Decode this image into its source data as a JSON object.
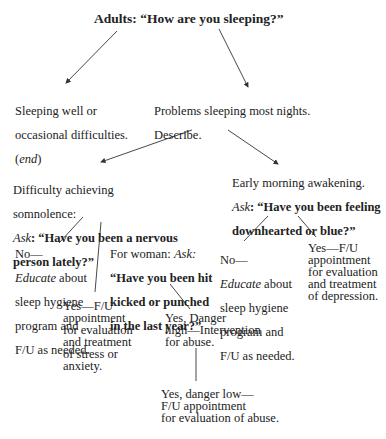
{
  "diagram": {
    "root": {
      "text": "Adults: “How are you sleeping?”"
    },
    "sleeping_well": {
      "line1": "Sleeping well or",
      "line2": "occasional difficulties.",
      "end_open": "(",
      "end_label": "end",
      "end_close": ")"
    },
    "problems": {
      "line1": "Problems sleeping most nights.",
      "line2": "Describe."
    },
    "somnolence": {
      "line1": "Difficulty achieving",
      "line2": "somnolence:",
      "ask_label": "Ask",
      "question_l1": ": “Have you been a nervous",
      "question_l2": "person lately?”"
    },
    "early_morning": {
      "line1": "Early morning awakening.",
      "ask_label": "Ask",
      "question_l1": ": “Have you been feeling",
      "question_l2": "downhearted or blue?”"
    },
    "no_left": {
      "line1": "No—",
      "educate": "Educate",
      "rest1": " about",
      "line3": "sleep hygiene",
      "line4": "program and",
      "line5": "F/U as needed."
    },
    "woman": {
      "prefix": "For woman: ",
      "ask_label": "Ask:",
      "q1": "“Have you been hit",
      "q2": "kicked or punched",
      "q3": "in the last year?”"
    },
    "yes_stress": {
      "text": "Yes—F/U\nappointment\nfor evaluation\nand treatment\nof stress or\nanxiety."
    },
    "danger_high": {
      "text": "Yes, Danger\nhigh—Intervention\nfor abuse."
    },
    "danger_low": {
      "text": "Yes, danger low—\nF/U appointment\nfor evaluation of abuse."
    },
    "no_right": {
      "line1": "No—",
      "educate": "Educate",
      "rest1": " about",
      "line3": "sleep hygiene",
      "line4": "program and",
      "line5": "F/U as needed."
    },
    "yes_depression": {
      "text": "Yes—F/U\nappointment\nfor evaluation\nand treatment\nof depression."
    }
  }
}
